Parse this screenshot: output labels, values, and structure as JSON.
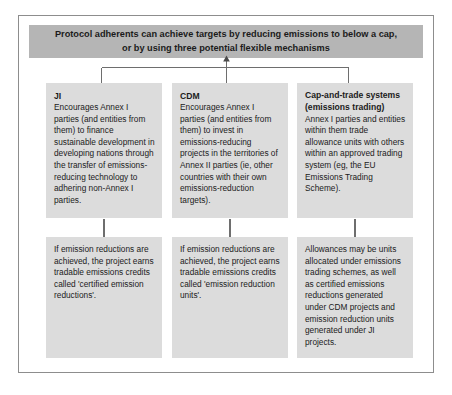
{
  "figure": {
    "type": "flowchart",
    "colors": {
      "banner_bg": "#b5b5b5",
      "box_bg": "#dcdcdc",
      "frame_border": "#8d8d8d",
      "text": "#1b1b1b",
      "connector": "#6e6e6e"
    }
  },
  "banner": {
    "line1": "Protocol adherents can achieve targets by reducing emissions to below a cap,",
    "line2": "or by using three potential flexible mechanisms"
  },
  "columns": [
    {
      "id": "ji",
      "top": {
        "heading": "JI",
        "body": "Encourages Annex I parties (and entities from them) to finance sustainable development in developing nations through the transfer of emissions-reducing technology to adhering non-Annex I parties."
      },
      "bottom": {
        "body": "If emission reductions are achieved, the project earns tradable emissions credits called 'certified emission reductions'."
      }
    },
    {
      "id": "cdm",
      "top": {
        "heading": "CDM",
        "body": "Encourages Annex I parties (and entities from them) to invest in emissions-reducing projects in the territories of Annex II parties (ie, other countries with their own emissions-reduction targets)."
      },
      "bottom": {
        "body": "If emission reductions are achieved, the project earns tradable emissions credits called 'emission reduction units'."
      }
    },
    {
      "id": "cap-and-trade",
      "top": {
        "heading": "Cap-and-trade systems (emissions trading)",
        "body": "Annex I parties and entities within them trade allowance units with others within an approved trading system (eg, the EU Emissions Trading Scheme)."
      },
      "bottom": {
        "body": "Allowances may be units allocated under emissions trading schemes, as well as certified emissions reductions generated under CDM projects and emission reduction units generated under JI projects."
      }
    }
  ]
}
